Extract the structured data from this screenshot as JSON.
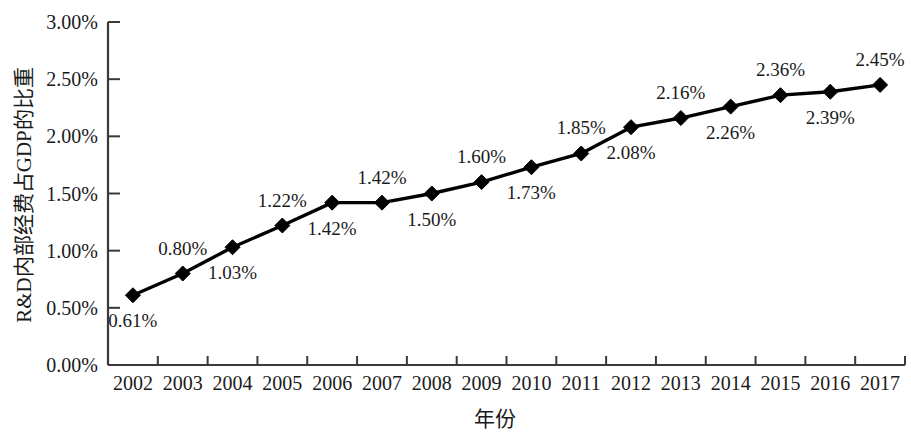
{
  "chart_data": {
    "type": "line",
    "title": "",
    "subtitle": "",
    "xlabel": "年份",
    "ylabel": "R&D内部经费占GDP的比重",
    "categories": [
      "2002",
      "2003",
      "2004",
      "2005",
      "2006",
      "2007",
      "2008",
      "2009",
      "2010",
      "2011",
      "2012",
      "2013",
      "2014",
      "2015",
      "2016",
      "2017"
    ],
    "values": [
      0.61,
      0.8,
      1.03,
      1.22,
      1.42,
      1.42,
      1.5,
      1.6,
      1.73,
      1.85,
      2.08,
      2.16,
      2.26,
      2.36,
      2.39,
      2.45
    ],
    "point_labels": [
      "0.61%",
      "0.80%",
      "1.03%",
      "1.22%",
      "1.42%",
      "1.42%",
      "1.50%",
      "1.60%",
      "1.73%",
      "1.85%",
      "2.08%",
      "2.16%",
      "2.26%",
      "2.36%",
      "2.39%",
      "2.45%"
    ],
    "label_positions": [
      "below",
      "above",
      "below",
      "above",
      "below",
      "above",
      "below",
      "above",
      "below",
      "above",
      "below",
      "above",
      "below",
      "above",
      "below",
      "above"
    ],
    "ylim": [
      0,
      3.0
    ],
    "ytick_values": [
      0,
      0.5,
      1.0,
      1.5,
      2.0,
      2.5,
      3.0
    ],
    "ytick_labels": [
      "0.00%",
      "0.50%",
      "1.00%",
      "1.50%",
      "2.00%",
      "2.50%",
      "3.00%"
    ],
    "grid": false,
    "legend": null,
    "series_color": "#000000",
    "marker": "diamond",
    "unit": "%"
  }
}
